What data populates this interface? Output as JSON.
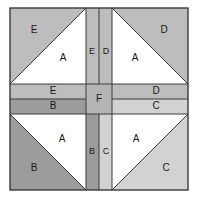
{
  "figure": {
    "type": "quilt-block-diagram",
    "canvas": {
      "width": 198,
      "height": 202
    },
    "block": {
      "x": 10,
      "y": 8,
      "width": 178,
      "height": 182
    }
  },
  "colors": {
    "background": "#ffffff",
    "outline": "#3b3b3b",
    "piece_a": "#ffffff",
    "piece_b": "#9c9c9c",
    "piece_c": "#d2d2d2",
    "piece_d": "#bdbdbd",
    "piece_e": "#bdbdbd",
    "piece_f": "#b5b5b5",
    "label_text": "#1a1a1a"
  },
  "legend": {
    "pieces": [
      {
        "id": "A",
        "label": "A",
        "color": "#ffffff",
        "shape": "half-square-triangle",
        "count": 4
      },
      {
        "id": "B",
        "label": "B",
        "color": "#9c9c9c",
        "shape": "half-square-triangle",
        "count": 1
      },
      {
        "id": "C",
        "label": "C",
        "color": "#d2d2d2",
        "shape": "half-square-triangle",
        "count": 1
      },
      {
        "id": "D",
        "label": "D",
        "color": "#bdbdbd",
        "shape": "half-square-triangle",
        "count": 1
      },
      {
        "id": "E",
        "label": "E",
        "color": "#bdbdbd",
        "shape": "half-square-triangle",
        "count": 1
      },
      {
        "id": "F",
        "label": "F",
        "color": "#b5b5b5",
        "shape": "center-square",
        "count": 1
      }
    ]
  },
  "quadrants": {
    "top_left": {
      "name": "top-left",
      "outer_triangle": {
        "id": "E",
        "label": "E",
        "color": "#bdbdbd"
      },
      "inner_triangle": {
        "id": "A",
        "label": "A",
        "color": "#ffffff"
      }
    },
    "top_right": {
      "name": "top-right",
      "outer_triangle": {
        "id": "D",
        "label": "D",
        "color": "#bdbdbd"
      },
      "inner_triangle": {
        "id": "A",
        "label": "A",
        "color": "#ffffff"
      }
    },
    "bottom_left": {
      "name": "bottom-left",
      "outer_triangle": {
        "id": "B",
        "label": "B",
        "color": "#9c9c9c"
      },
      "inner_triangle": {
        "id": "A",
        "label": "A",
        "color": "#ffffff"
      }
    },
    "bottom_right": {
      "name": "bottom-right",
      "outer_triangle": {
        "id": "C",
        "label": "C",
        "color": "#d2d2d2"
      },
      "inner_triangle": {
        "id": "A",
        "label": "A",
        "color": "#ffffff"
      }
    }
  },
  "sashing": {
    "vertical_top": [
      {
        "id": "E",
        "label": "E",
        "color": "#bdbdbd",
        "position": "left"
      },
      {
        "id": "D",
        "label": "D",
        "color": "#bdbdbd",
        "position": "right"
      }
    ],
    "vertical_bottom": [
      {
        "id": "B",
        "label": "B",
        "color": "#9c9c9c",
        "position": "left"
      },
      {
        "id": "C",
        "label": "C",
        "color": "#d2d2d2",
        "position": "right"
      }
    ],
    "horizontal_left": [
      {
        "id": "E",
        "label": "E",
        "color": "#bdbdbd",
        "position": "top"
      },
      {
        "id": "B",
        "label": "B",
        "color": "#9c9c9c",
        "position": "bottom"
      }
    ],
    "horizontal_right": [
      {
        "id": "D",
        "label": "D",
        "color": "#bdbdbd",
        "position": "top"
      },
      {
        "id": "C",
        "label": "C",
        "color": "#d2d2d2",
        "position": "bottom"
      }
    ],
    "center": {
      "id": "F",
      "label": "F",
      "color": "#b5b5b5"
    }
  },
  "labels": {
    "tl_outer": "E",
    "tl_inner": "A",
    "tr_outer": "D",
    "tr_inner": "A",
    "bl_outer": "B",
    "bl_inner": "A",
    "br_outer": "C",
    "br_inner": "A",
    "vtop_left": "E",
    "vtop_right": "D",
    "vbot_left": "B",
    "vbot_right": "C",
    "hleft_top": "E",
    "hleft_bot": "B",
    "hright_top": "D",
    "hright_bot": "C",
    "center": "F"
  }
}
